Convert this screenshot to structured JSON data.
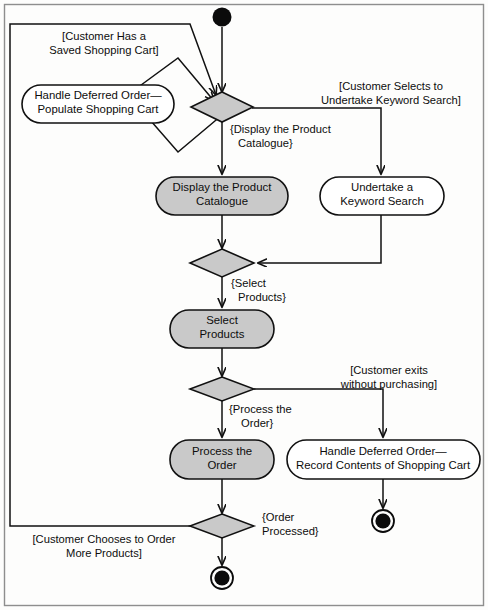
{
  "diagram": {
    "type": "uml-activity-diagram",
    "colors": {
      "activity_fill_highlight": "#c9c9c9",
      "activity_fill_plain": "#ffffff",
      "decision_fill": "#c9c9c9",
      "line": "#111111",
      "background": "#fdfdfc"
    },
    "nodes": [
      {
        "id": "start",
        "kind": "initial-node",
        "label": ""
      },
      {
        "id": "decision-1",
        "kind": "decision",
        "label": ""
      },
      {
        "id": "handle-deferred-populate",
        "kind": "activity",
        "filled": false,
        "label_line_1": "Handle Deferred Order—",
        "label_line_2": "Populate Shopping Cart"
      },
      {
        "id": "display-catalogue",
        "kind": "activity",
        "filled": true,
        "label_line_1": "Display the Product",
        "label_line_2": "Catalogue"
      },
      {
        "id": "keyword-search",
        "kind": "activity",
        "filled": false,
        "label_line_1": "Undertake a",
        "label_line_2": "Keyword Search"
      },
      {
        "id": "decision-2",
        "kind": "decision",
        "label": ""
      },
      {
        "id": "select-products",
        "kind": "activity",
        "filled": true,
        "label_line_1": "Select",
        "label_line_2": "Products"
      },
      {
        "id": "decision-3",
        "kind": "decision",
        "label": ""
      },
      {
        "id": "process-order",
        "kind": "activity",
        "filled": true,
        "label_line_1": "Process the",
        "label_line_2": "Order"
      },
      {
        "id": "handle-deferred-record",
        "kind": "activity",
        "filled": false,
        "label_line_1": "Handle Deferred Order—",
        "label_line_2": "Record Contents of Shopping Cart"
      },
      {
        "id": "decision-4",
        "kind": "decision",
        "label": ""
      },
      {
        "id": "end-right",
        "kind": "final-node",
        "label": ""
      },
      {
        "id": "end-bottom",
        "kind": "final-node",
        "label": ""
      }
    ],
    "guards": [
      {
        "id": "guard-saved-cart",
        "line_1": "[Customer Has a",
        "line_2": "Saved Shopping Cart]"
      },
      {
        "id": "guard-keyword-search",
        "line_1": "[Customer Selects to",
        "line_2": "Undertake Keyword Search]"
      },
      {
        "id": "guard-display-catalogue",
        "line_1": "{Display the Product",
        "line_2": "Catalogue}"
      },
      {
        "id": "guard-select-products",
        "line_1": "{Select",
        "line_2": "Products}"
      },
      {
        "id": "guard-customer-exits",
        "line_1": "[Customer exits",
        "line_2": "without purchasing]"
      },
      {
        "id": "guard-process-order",
        "line_1": "{Process the",
        "line_2": "Order}"
      },
      {
        "id": "guard-order-processed",
        "line_1": "{Order",
        "line_2": "Processed}"
      },
      {
        "id": "guard-order-more",
        "line_1": "[Customer Chooses to Order",
        "line_2": "More Products]"
      }
    ]
  }
}
